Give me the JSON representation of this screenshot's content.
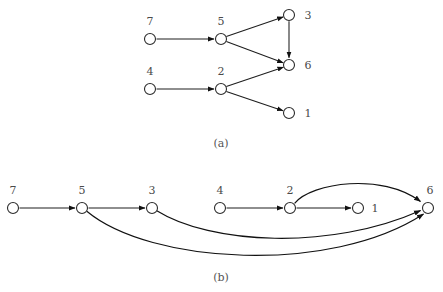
{
  "figure": {
    "width": 443,
    "height": 292,
    "background": "#ffffff",
    "stroke_color": "#1e1e1e",
    "node_fill": "#ffffff",
    "node_stroke": "#2b2b2b",
    "label_color": "#4a4a4a"
  },
  "panels": [
    {
      "id": "panel-a",
      "caption": "(a)",
      "caption_pos": {
        "x": 221,
        "y": 147
      },
      "nodes": [
        {
          "id": "n7a",
          "label": "7",
          "x": 150,
          "y": 39,
          "r": 5.5,
          "label_x": 150,
          "label_y": 25
        },
        {
          "id": "n5a",
          "label": "5",
          "x": 221,
          "y": 39,
          "r": 5.5,
          "label_x": 221,
          "label_y": 25
        },
        {
          "id": "n3a",
          "label": "3",
          "x": 289,
          "y": 15,
          "r": 5.5,
          "label_x": 308,
          "label_y": 19
        },
        {
          "id": "n6a",
          "label": "6",
          "x": 289,
          "y": 65,
          "r": 5.5,
          "label_x": 308,
          "label_y": 69
        },
        {
          "id": "n4a",
          "label": "4",
          "x": 150,
          "y": 89,
          "r": 5.5,
          "label_x": 150,
          "label_y": 75
        },
        {
          "id": "n2a",
          "label": "2",
          "x": 221,
          "y": 89,
          "r": 5.5,
          "label_x": 221,
          "label_y": 75
        },
        {
          "id": "n1a",
          "label": "1",
          "x": 289,
          "y": 113,
          "r": 5.5,
          "label_x": 308,
          "label_y": 117
        }
      ],
      "edges": [
        {
          "id": "e-7-5",
          "from": "7",
          "to": "5",
          "kind": "straight"
        },
        {
          "id": "e-5-3",
          "from": "5",
          "to": "3",
          "kind": "straight"
        },
        {
          "id": "e-5-6",
          "from": "5",
          "to": "6",
          "kind": "straight"
        },
        {
          "id": "e-3-6",
          "from": "3",
          "to": "6",
          "kind": "straight"
        },
        {
          "id": "e-4-2",
          "from": "4",
          "to": "2",
          "kind": "straight"
        },
        {
          "id": "e-2-6",
          "from": "2",
          "to": "6",
          "kind": "straight"
        },
        {
          "id": "e-2-1",
          "from": "2",
          "to": "1",
          "kind": "straight"
        }
      ]
    },
    {
      "id": "panel-b",
      "caption": "(b)",
      "caption_pos": {
        "x": 221,
        "y": 281
      },
      "nodes": [
        {
          "id": "n7b",
          "label": "7",
          "x": 13,
          "y": 208,
          "r": 5.5,
          "label_x": 13,
          "label_y": 194
        },
        {
          "id": "n5b",
          "label": "5",
          "x": 82,
          "y": 208,
          "r": 5.5,
          "label_x": 82,
          "label_y": 194
        },
        {
          "id": "n3b",
          "label": "3",
          "x": 152,
          "y": 208,
          "r": 5.5,
          "label_x": 152,
          "label_y": 194
        },
        {
          "id": "n4b",
          "label": "4",
          "x": 220,
          "y": 208,
          "r": 5.5,
          "label_x": 220,
          "label_y": 194
        },
        {
          "id": "n2b",
          "label": "2",
          "x": 290,
          "y": 208,
          "r": 5.5,
          "label_x": 290,
          "label_y": 194
        },
        {
          "id": "n1b",
          "label": "1",
          "x": 358,
          "y": 208,
          "r": 5.5,
          "label_x": 375,
          "label_y": 212
        },
        {
          "id": "n6b",
          "label": "6",
          "x": 428,
          "y": 208,
          "r": 5.5,
          "label_x": 430,
          "label_y": 194
        }
      ],
      "edges": [
        {
          "id": "eb-7-5",
          "from": "7",
          "to": "5",
          "kind": "straight"
        },
        {
          "id": "eb-5-3",
          "from": "5",
          "to": "3",
          "kind": "straight"
        },
        {
          "id": "eb-4-2",
          "from": "4",
          "to": "2",
          "kind": "straight"
        },
        {
          "id": "eb-2-1",
          "from": "2",
          "to": "1",
          "kind": "straight"
        },
        {
          "id": "eb-2-6",
          "from": "2",
          "to": "6",
          "kind": "arc-above"
        },
        {
          "id": "eb-3-6",
          "from": "3",
          "to": "6",
          "kind": "arc-below"
        },
        {
          "id": "eb-5-6",
          "from": "5",
          "to": "6",
          "kind": "arc-below-deep"
        }
      ]
    }
  ]
}
